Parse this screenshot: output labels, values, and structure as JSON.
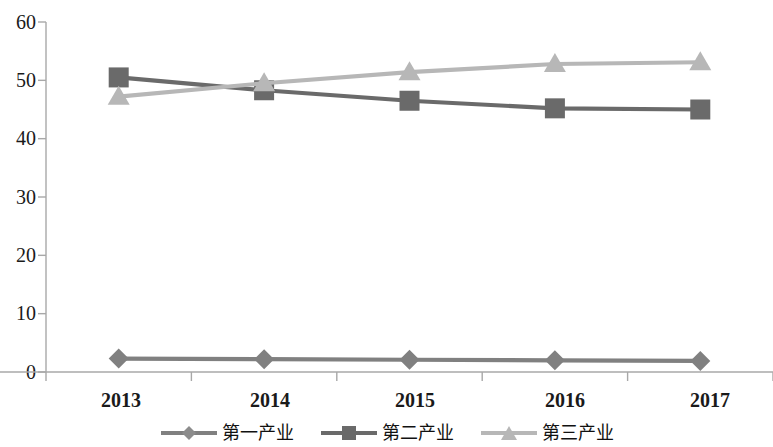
{
  "chart_data": {
    "type": "line",
    "title": "",
    "subtitle": "",
    "xlabel": "",
    "ylabel": "",
    "categories": [
      "2013",
      "2014",
      "2015",
      "2016",
      "2017"
    ],
    "ylim": [
      0,
      60
    ],
    "yticks": [
      0,
      10,
      20,
      30,
      40,
      50,
      60
    ],
    "grid": false,
    "legend_position": "bottom",
    "series": [
      {
        "name": "第一产业",
        "marker": "diamond",
        "color": "#808080",
        "values": [
          2.3,
          2.2,
          2.1,
          2.0,
          1.9
        ]
      },
      {
        "name": "第二产业",
        "marker": "square",
        "color": "#6a6a6a",
        "values": [
          50.5,
          48.3,
          46.5,
          45.2,
          45.0
        ]
      },
      {
        "name": "第三产业",
        "marker": "triangle",
        "color": "#b7b7b7",
        "values": [
          47.2,
          49.5,
          51.4,
          52.8,
          53.1
        ]
      }
    ]
  },
  "axis": {
    "y_tick_labels": [
      "60",
      "50",
      "40",
      "30",
      "20",
      "10",
      "0"
    ],
    "x_tick_labels": [
      "2013",
      "2014",
      "2015",
      "2016",
      "2017"
    ]
  },
  "legend": {
    "items": [
      {
        "label": "第一产業-placeholder",
        "name": "第一产业",
        "icon": "diamond-marker-icon"
      },
      {
        "label": "第二産業-placeholder",
        "name": "第二产业",
        "icon": "square-marker-icon"
      },
      {
        "label": "第三産業-placeholder",
        "name": "第三产业",
        "icon": "triangle-marker-icon"
      }
    ],
    "labels": [
      "第一产业",
      "第二产业",
      "第三产业"
    ]
  },
  "colors": {
    "series_1": "#808080",
    "series_2": "#6a6a6a",
    "series_3": "#b7b7b7",
    "axis": "#a8a8a8",
    "text": "#1a1a1a",
    "background": "#ffffff"
  }
}
